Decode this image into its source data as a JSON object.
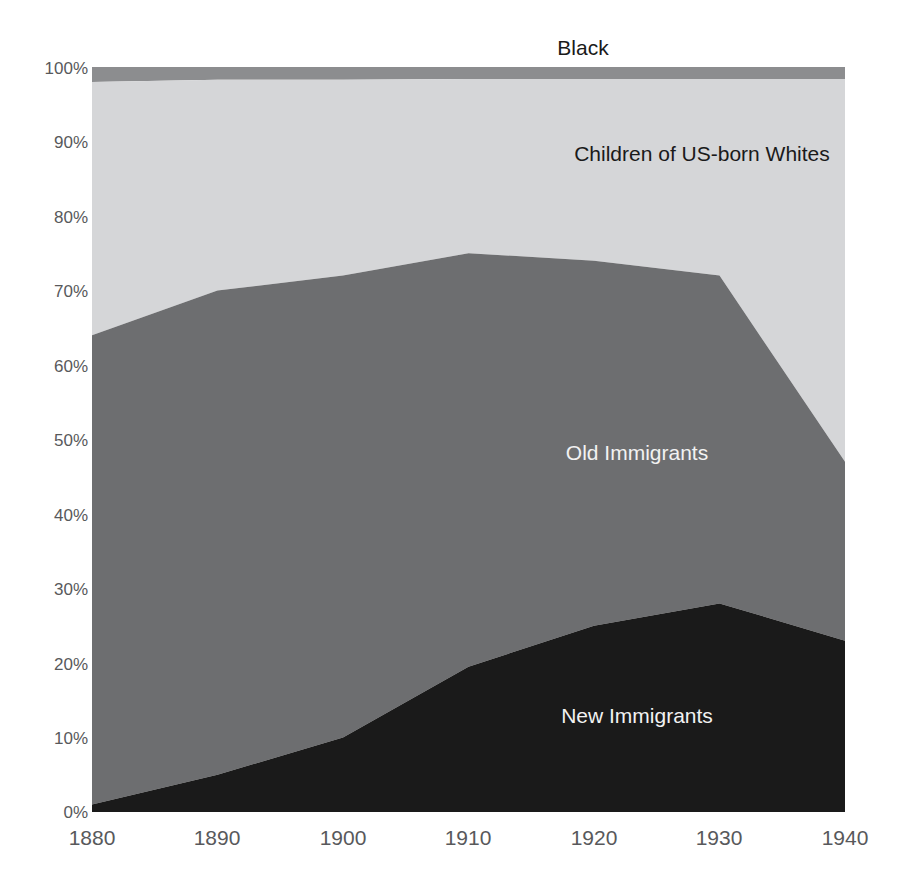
{
  "chart_data": {
    "type": "area",
    "title": "",
    "subtitle": "",
    "xlabel": "",
    "ylabel": "",
    "stacked": true,
    "grid": false,
    "legend_position": "inline-labels",
    "x": [
      1880,
      1890,
      1900,
      1910,
      1920,
      1930,
      1940
    ],
    "xtick_labels": [
      "1880",
      "1890",
      "1900",
      "1910",
      "1920",
      "1930",
      "1940"
    ],
    "xlim": [
      1880,
      1940
    ],
    "ylim": [
      0,
      100
    ],
    "ytick_values": [
      0,
      10,
      20,
      30,
      40,
      50,
      60,
      70,
      80,
      90,
      100
    ],
    "ytick_labels": [
      "0%",
      "10%",
      "20%",
      "30%",
      "40%",
      "50%",
      "60%",
      "70%",
      "80%",
      "90%",
      "100%"
    ],
    "series": [
      {
        "name": "New Immigrants",
        "color": "#1a1a1a",
        "label_color": "#f2f2f2",
        "values": [
          1,
          5,
          10,
          19.5,
          25,
          28,
          23
        ],
        "cumulative_top": [
          1,
          5,
          10,
          19.5,
          25,
          28,
          23
        ]
      },
      {
        "name": "Old Immigrants",
        "color": "#6d6e70",
        "label_color": "#f2f2f2",
        "values": [
          63,
          65,
          62,
          55.5,
          49,
          44,
          24
        ],
        "cumulative_top": [
          64,
          70,
          72,
          75,
          74,
          72,
          47
        ]
      },
      {
        "name": "Children of US-born Whites",
        "color": "#d5d6d8",
        "label_color": "#1a1a1a",
        "values": [
          34,
          28.3,
          26.3,
          23.4,
          24.4,
          26.4,
          51.4
        ],
        "cumulative_top": [
          98,
          98.3,
          98.3,
          98.4,
          98.4,
          98.4,
          98.4
        ]
      },
      {
        "name": "Black",
        "color": "#8c8d8f",
        "label_color": "#1a1a1a",
        "values": [
          2,
          1.7,
          1.7,
          1.6,
          1.6,
          1.6,
          1.6
        ],
        "cumulative_top": [
          100,
          100,
          100,
          100,
          100,
          100,
          100
        ]
      }
    ],
    "annotations": [
      {
        "text": "Black",
        "x_px": 583,
        "y_px": 55,
        "color": "#1a1a1a"
      },
      {
        "text": "Children of US-born Whites",
        "x_px": 702,
        "y_px": 161,
        "color": "#1a1a1a"
      },
      {
        "text": "Old Immigrants",
        "x_px": 637,
        "y_px": 460,
        "color": "#f2f2f2"
      },
      {
        "text": "New Immigrants",
        "x_px": 637,
        "y_px": 723,
        "color": "#f2f2f2"
      }
    ]
  },
  "colors": {
    "background": "#ffffff",
    "axis_text": "#58595b",
    "new_immigrants": "#1a1a1a",
    "old_immigrants": "#6d6e70",
    "children_us_born_whites": "#d5d6d8",
    "black_band": "#8c8d8f"
  },
  "labels": {
    "black": "Black",
    "children": "Children of US-born Whites",
    "old_immigrants": "Old Immigrants",
    "new_immigrants": "New Immigrants"
  },
  "yticks": {
    "t100": "100%",
    "t90": "90%",
    "t80": "80%",
    "t70": "70%",
    "t60": "60%",
    "t50": "50%",
    "t40": "40%",
    "t30": "30%",
    "t20": "20%",
    "t10": "10%",
    "t0": "0%"
  },
  "xticks": {
    "t1880": "1880",
    "t1890": "1890",
    "t1900": "1900",
    "t1910": "1910",
    "t1920": "1920",
    "t1930": "1930",
    "t1940": "1940"
  }
}
